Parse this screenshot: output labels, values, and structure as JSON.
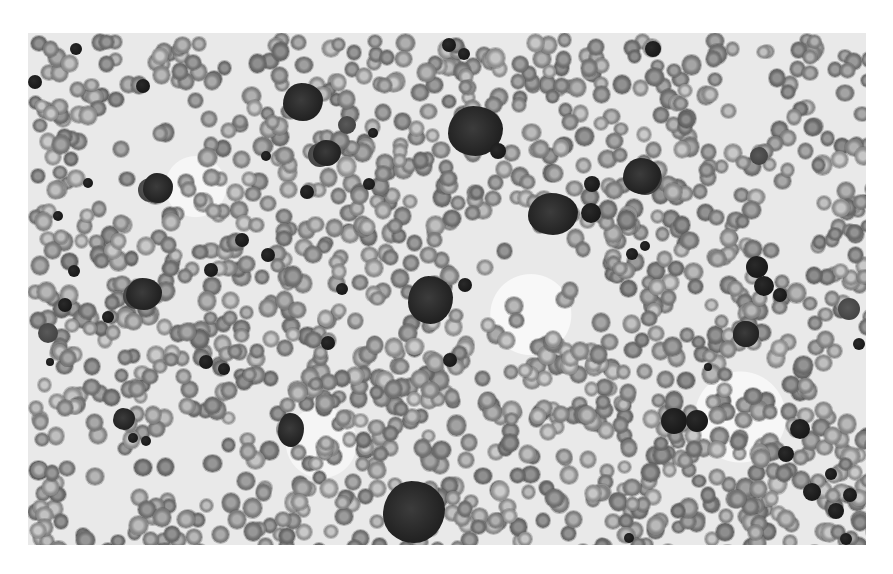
{
  "image": {
    "description": "Grayscale light micrograph of a blood/bone marrow smear showing numerous red blood cells, scattered small dark nucleated cells, and several large dark blast cells",
    "background": "#ffffff",
    "panel": {
      "x": 28,
      "y": 33,
      "width": 838,
      "height": 512,
      "tone": "#e9e9e9"
    },
    "rbc_color": "#8a8a8a",
    "nucleus_color": "#151515",
    "blasts": [
      {
        "x": 420,
        "y": 73,
        "w": 55,
        "h": 50
      },
      {
        "x": 380,
        "y": 243,
        "w": 45,
        "h": 48
      },
      {
        "x": 500,
        "y": 160,
        "w": 50,
        "h": 42
      },
      {
        "x": 355,
        "y": 448,
        "w": 62,
        "h": 62
      },
      {
        "x": 595,
        "y": 125,
        "w": 38,
        "h": 36
      },
      {
        "x": 705,
        "y": 288,
        "w": 26,
        "h": 26
      },
      {
        "x": 255,
        "y": 50,
        "w": 40,
        "h": 38
      },
      {
        "x": 98,
        "y": 245,
        "w": 36,
        "h": 32
      },
      {
        "x": 115,
        "y": 140,
        "w": 30,
        "h": 30
      },
      {
        "x": 285,
        "y": 107,
        "w": 28,
        "h": 26
      },
      {
        "x": 250,
        "y": 380,
        "w": 26,
        "h": 34
      },
      {
        "x": 85,
        "y": 375,
        "w": 22,
        "h": 22
      }
    ],
    "nuclei": [
      {
        "x": 108,
        "y": 46,
        "d": 14
      },
      {
        "x": 0,
        "y": 42,
        "d": 14
      },
      {
        "x": 42,
        "y": 10,
        "d": 12
      },
      {
        "x": 272,
        "y": 152,
        "d": 14
      },
      {
        "x": 233,
        "y": 118,
        "d": 10
      },
      {
        "x": 207,
        "y": 200,
        "d": 14
      },
      {
        "x": 176,
        "y": 230,
        "d": 14
      },
      {
        "x": 414,
        "y": 5,
        "d": 14
      },
      {
        "x": 430,
        "y": 15,
        "d": 12
      },
      {
        "x": 617,
        "y": 8,
        "d": 16
      },
      {
        "x": 462,
        "y": 110,
        "d": 16
      },
      {
        "x": 553,
        "y": 170,
        "d": 20
      },
      {
        "x": 556,
        "y": 143,
        "d": 16
      },
      {
        "x": 612,
        "y": 208,
        "d": 10
      },
      {
        "x": 718,
        "y": 223,
        "d": 22
      },
      {
        "x": 726,
        "y": 243,
        "d": 20
      },
      {
        "x": 745,
        "y": 255,
        "d": 14
      },
      {
        "x": 633,
        "y": 375,
        "d": 26
      },
      {
        "x": 658,
        "y": 377,
        "d": 22
      },
      {
        "x": 762,
        "y": 386,
        "d": 20
      },
      {
        "x": 775,
        "y": 450,
        "d": 18
      },
      {
        "x": 800,
        "y": 470,
        "d": 16
      },
      {
        "x": 815,
        "y": 455,
        "d": 14
      },
      {
        "x": 797,
        "y": 435,
        "d": 12
      },
      {
        "x": 812,
        "y": 500,
        "d": 12
      },
      {
        "x": 750,
        "y": 413,
        "d": 16
      },
      {
        "x": 415,
        "y": 320,
        "d": 14
      },
      {
        "x": 430,
        "y": 245,
        "d": 14
      },
      {
        "x": 308,
        "y": 250,
        "d": 12
      },
      {
        "x": 233,
        "y": 215,
        "d": 14
      },
      {
        "x": 30,
        "y": 265,
        "d": 14
      },
      {
        "x": 40,
        "y": 232,
        "d": 12
      },
      {
        "x": 74,
        "y": 278,
        "d": 12
      },
      {
        "x": 55,
        "y": 145,
        "d": 10
      },
      {
        "x": 25,
        "y": 178,
        "d": 10
      },
      {
        "x": 100,
        "y": 400,
        "d": 10
      },
      {
        "x": 113,
        "y": 403,
        "d": 10
      },
      {
        "x": 171,
        "y": 322,
        "d": 14
      },
      {
        "x": 190,
        "y": 330,
        "d": 12
      },
      {
        "x": 293,
        "y": 303,
        "d": 14
      },
      {
        "x": 335,
        "y": 145,
        "d": 12
      },
      {
        "x": 340,
        "y": 95,
        "d": 10
      },
      {
        "x": 598,
        "y": 215,
        "d": 12
      },
      {
        "x": 676,
        "y": 330,
        "d": 8
      },
      {
        "x": 18,
        "y": 325,
        "d": 8
      },
      {
        "x": 825,
        "y": 305,
        "d": 12
      },
      {
        "x": 596,
        "y": 500,
        "d": 10
      }
    ],
    "mono_cells": [
      {
        "x": 600,
        "y": 128,
        "d": 34
      },
      {
        "x": 705,
        "y": 288,
        "d": 26
      },
      {
        "x": 280,
        "y": 110,
        "d": 24
      },
      {
        "x": 310,
        "y": 83,
        "d": 18
      },
      {
        "x": 110,
        "y": 145,
        "d": 24
      },
      {
        "x": 10,
        "y": 290,
        "d": 20
      },
      {
        "x": 722,
        "y": 114,
        "d": 18
      },
      {
        "x": 810,
        "y": 265,
        "d": 22
      },
      {
        "x": 95,
        "y": 250,
        "d": 26
      }
    ]
  }
}
